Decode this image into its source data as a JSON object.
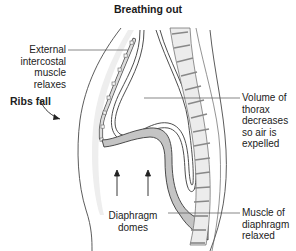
{
  "title": "Breathing out",
  "labels": {
    "external_intercostal": [
      "External",
      "intercostal",
      "muscle",
      "relaxes"
    ],
    "ribs_fall": "Ribs fall",
    "volume_thorax": [
      "Volume of",
      "thorax",
      "decreases",
      "so air is",
      "expelled"
    ],
    "diaphragm_domes": [
      "Diaphragm",
      "domes"
    ],
    "muscle_diaphragm": [
      "Muscle of",
      "diaphragm",
      "relaxed"
    ]
  },
  "colors": {
    "line": "#3a3a3a",
    "tissue_fill": "#e9e9e9",
    "vertebra_fill": "#ececec",
    "muscle_fill": "#bdbdbd",
    "text": "#1a1a1a"
  }
}
